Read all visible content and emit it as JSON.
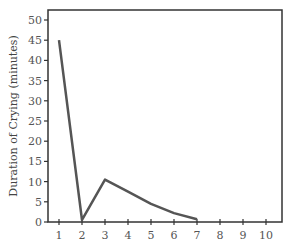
{
  "chart_data": {
    "type": "line",
    "title": "",
    "xlabel": "",
    "ylabel": "Duration of Crying (minutes)",
    "x": [
      1,
      2,
      3,
      4,
      5,
      6,
      7
    ],
    "series": [
      {
        "name": "Duration of Crying",
        "values": [
          45,
          0.5,
          10.5,
          7.5,
          4.5,
          2.2,
          0.7
        ]
      }
    ],
    "xlim": [
      0.6,
      10.7
    ],
    "ylim": [
      0,
      52
    ],
    "xticks": [
      "1",
      "2",
      "3",
      "4",
      "5",
      "6",
      "7",
      "8",
      "9",
      "10"
    ],
    "yticks": [
      "0",
      "5",
      "10",
      "15",
      "20",
      "25",
      "30",
      "35",
      "40",
      "45",
      "50"
    ],
    "grid": false,
    "legend": "none",
    "line_color": "#555555"
  }
}
